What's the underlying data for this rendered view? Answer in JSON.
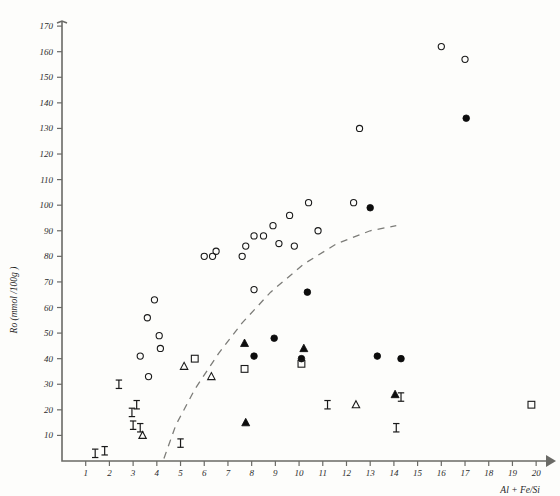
{
  "chart_data": {
    "type": "scatter",
    "title": "",
    "xlabel": "Al + Fe/Si",
    "ylabel": "Ro (mmol /100g )",
    "xlim": [
      0,
      20.5
    ],
    "ylim": [
      0,
      172
    ],
    "xticks": [
      1,
      2,
      3,
      4,
      5,
      6,
      7,
      8,
      9,
      10,
      11,
      12,
      13,
      14,
      15,
      16,
      17,
      18,
      19,
      20
    ],
    "yticks": [
      10,
      20,
      30,
      40,
      50,
      60,
      70,
      80,
      90,
      100,
      110,
      120,
      130,
      140,
      150,
      160,
      170
    ],
    "grid": false,
    "legend": "none",
    "annotations": [
      {
        "name": "trend-curve",
        "style": "dashed",
        "points": [
          [
            4.3,
            1
          ],
          [
            4.8,
            14
          ],
          [
            5.6,
            28
          ],
          [
            6.6,
            42
          ],
          [
            7.6,
            54
          ],
          [
            8.8,
            66
          ],
          [
            10.2,
            77
          ],
          [
            11.6,
            85
          ],
          [
            13.0,
            90
          ],
          [
            14.1,
            92
          ]
        ]
      }
    ],
    "series": [
      {
        "name": "open-circle",
        "marker": "open-circle",
        "points": [
          [
            3.9,
            63
          ],
          [
            3.6,
            56
          ],
          [
            4.1,
            49
          ],
          [
            4.15,
            44
          ],
          [
            3.3,
            41
          ],
          [
            3.65,
            33
          ],
          [
            6.0,
            80
          ],
          [
            6.35,
            80
          ],
          [
            6.5,
            82
          ],
          [
            7.6,
            80
          ],
          [
            7.75,
            84
          ],
          [
            8.1,
            88
          ],
          [
            8.5,
            88
          ],
          [
            8.9,
            92
          ],
          [
            9.15,
            85
          ],
          [
            9.6,
            96
          ],
          [
            9.8,
            84
          ],
          [
            10.4,
            101
          ],
          [
            10.8,
            90
          ],
          [
            12.3,
            101
          ],
          [
            12.55,
            130
          ],
          [
            8.1,
            67
          ],
          [
            16.0,
            162
          ],
          [
            17.0,
            157
          ]
        ]
      },
      {
        "name": "filled-circle",
        "marker": "filled-circle",
        "points": [
          [
            8.1,
            41
          ],
          [
            8.95,
            48
          ],
          [
            10.1,
            40
          ],
          [
            10.35,
            66
          ],
          [
            13.0,
            99
          ],
          [
            13.3,
            41
          ],
          [
            14.3,
            40
          ],
          [
            17.05,
            134
          ]
        ]
      },
      {
        "name": "open-square",
        "marker": "open-square",
        "points": [
          [
            5.6,
            40
          ],
          [
            7.7,
            36
          ],
          [
            10.1,
            38
          ],
          [
            19.8,
            22
          ]
        ]
      },
      {
        "name": "filled-triangle",
        "marker": "filled-triangle",
        "points": [
          [
            7.7,
            46
          ],
          [
            7.75,
            15
          ],
          [
            10.2,
            44
          ],
          [
            14.05,
            26
          ]
        ]
      },
      {
        "name": "open-triangle",
        "marker": "open-triangle",
        "points": [
          [
            5.15,
            37
          ],
          [
            6.3,
            33
          ],
          [
            12.4,
            22
          ],
          [
            3.4,
            10
          ]
        ]
      },
      {
        "name": "ibeam",
        "marker": "ibeam",
        "points": [
          [
            1.4,
            3
          ],
          [
            1.8,
            4
          ],
          [
            2.4,
            30
          ],
          [
            3.15,
            22
          ],
          [
            2.95,
            19
          ],
          [
            3.0,
            14
          ],
          [
            3.3,
            13
          ],
          [
            5.0,
            7
          ],
          [
            11.2,
            22
          ],
          [
            14.3,
            25
          ],
          [
            14.1,
            13
          ]
        ]
      }
    ]
  }
}
